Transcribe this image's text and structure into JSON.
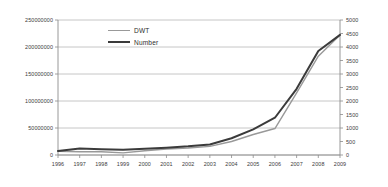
{
  "chart_data": {
    "type": "line",
    "title": "",
    "subtitle": "",
    "xlabel": "",
    "ylabel": "",
    "grid": true,
    "legend_position": "inside-top-left",
    "categories": [
      "1996",
      "1997",
      "1998",
      "1999",
      "2000",
      "2001",
      "2002",
      "2003",
      "2004",
      "2005",
      "2006",
      "2007",
      "2008",
      "2009"
    ],
    "x": [
      1996,
      1997,
      1998,
      1999,
      2000,
      2001,
      2002,
      2003,
      2004,
      2005,
      2006,
      2007,
      2008,
      2009
    ],
    "axes": {
      "x": {
        "ticks": [
          "1996",
          "1997",
          "1998",
          "1999",
          "2000",
          "2001",
          "2002",
          "2003",
          "2004",
          "2005",
          "2006",
          "2007",
          "2008",
          "2009"
        ]
      },
      "y_left": {
        "label": "",
        "ylim": [
          0,
          250000000
        ],
        "ticks": [
          "0",
          "50000000",
          "100000000",
          "150000000",
          "200000000",
          "250000000"
        ],
        "tick_values": [
          0,
          50000000,
          100000000,
          150000000,
          200000000,
          250000000
        ]
      },
      "y_right": {
        "label": "",
        "ylim": [
          0,
          5000
        ],
        "ticks": [
          "0",
          "500",
          "1000",
          "1500",
          "2000",
          "2500",
          "3000",
          "3500",
          "4000",
          "4500",
          "5000"
        ],
        "tick_values": [
          0,
          500,
          1000,
          1500,
          2000,
          2500,
          3000,
          3500,
          4000,
          4500,
          5000
        ]
      }
    },
    "series": [
      {
        "name": "DWT",
        "axis": "y_left",
        "color": "#999999",
        "width": 1.4,
        "values": [
          7000000,
          6000000,
          6000000,
          4000000,
          8000000,
          11000000,
          13000000,
          16000000,
          25000000,
          38000000,
          49000000,
          115000000,
          183000000,
          222000000
        ]
      },
      {
        "name": "Number",
        "axis": "y_right",
        "color": "#3b3b3b",
        "width": 2.0,
        "values": [
          150,
          240,
          210,
          190,
          230,
          270,
          320,
          390,
          620,
          950,
          1380,
          2450,
          3850,
          4450
        ]
      }
    ]
  },
  "legend": {
    "items": [
      {
        "label": "DWT",
        "color": "#999999"
      },
      {
        "label": "Number",
        "color": "#3b3b3b"
      }
    ]
  },
  "colors": {
    "dwt_line": "#999999",
    "number_line": "#3b3b3b",
    "grid": "#b8b8b8",
    "axis": "#8c8c8c",
    "text": "#3a3a3a",
    "background": "#ffffff"
  }
}
